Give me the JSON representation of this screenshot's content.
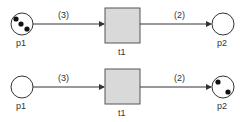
{
  "nets": [
    {
      "state": "before",
      "place_in": {
        "label": "p1",
        "tokens": 3
      },
      "transition": {
        "label": "t1"
      },
      "place_out": {
        "label": "p2",
        "tokens": 0
      },
      "arc_in": {
        "weight": "(3)"
      },
      "arc_out": {
        "weight": "(2)"
      }
    },
    {
      "state": "after",
      "place_in": {
        "label": "p1",
        "tokens": 0
      },
      "transition": {
        "label": "t1"
      },
      "place_out": {
        "label": "p2",
        "tokens": 2
      },
      "arc_in": {
        "weight": "(3)"
      },
      "arc_out": {
        "weight": "(2)"
      }
    }
  ],
  "colors": {
    "stroke": "#333333",
    "transition_fill": "#d9d9d9",
    "token": "#111111"
  }
}
